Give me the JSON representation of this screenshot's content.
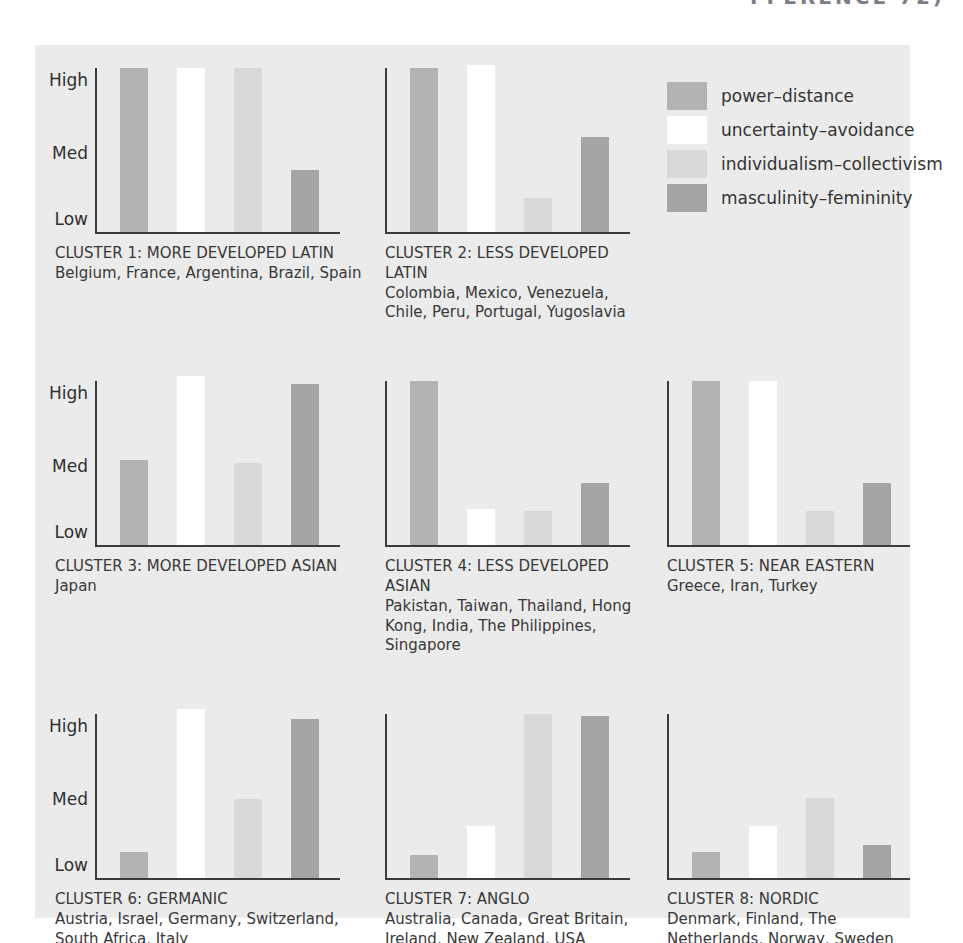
{
  "page": {
    "header_fragment": "FFERENCE 72)"
  },
  "colors": {
    "panel_bg": "#ebebeb",
    "axis": "#3b3b3b",
    "power_distance": "#b3b3b3",
    "uncertainty_avoidance": "#ffffff",
    "individualism_collectivism": "#d9d9d9",
    "masculinity_femininity": "#a5a5a5"
  },
  "axis_labels": [
    "High",
    "Med",
    "Low"
  ],
  "legend": {
    "items": [
      {
        "label": "power–distance",
        "color_key": "power_distance"
      },
      {
        "label": "uncertainty–avoidance",
        "color_key": "uncertainty_avoidance"
      },
      {
        "label": "individualism–collectivism",
        "color_key": "individualism_collectivism"
      },
      {
        "label": "masculinity–femininity",
        "color_key": "masculinity_femininity"
      }
    ]
  },
  "chart_data": {
    "type": "bar",
    "note": "Eight small bar charts; y axis is an ordinal High/Med/Low scale. Values are fractions of full axis height (High = 1.0, Med = 0.5, Low = 0.1).",
    "series_labels": [
      "power–distance",
      "uncertainty–avoidance",
      "individualism–collectivism",
      "masculinity–femininity"
    ],
    "series_color_keys": [
      "power_distance",
      "uncertainty_avoidance",
      "individualism_collectivism",
      "masculinity_femininity"
    ],
    "ylim": [
      0,
      1
    ],
    "yticks": [
      "High",
      "Med",
      "Low"
    ],
    "grid": false,
    "legend_position": "top-right",
    "clusters": [
      {
        "title": "CLUSTER 1: MORE DEVELOPED LATIN",
        "countries": "Belgium, France, Argentina, Brazil, Spain",
        "values": [
          1.0,
          1.0,
          1.0,
          0.38
        ],
        "show_axis_labels": true
      },
      {
        "title": "CLUSTER 2: LESS DEVELOPED LATIN",
        "countries": "Colombia, Mexico, Venezuela, Chile, Peru, Portugal, Yugoslavia",
        "values": [
          1.0,
          1.02,
          0.21,
          0.58
        ],
        "show_axis_labels": false
      },
      {
        "title": "CLUSTER 3: MORE DEVELOPED ASIAN",
        "countries": "Japan",
        "values": [
          0.52,
          1.03,
          0.5,
          0.98
        ],
        "show_axis_labels": true
      },
      {
        "title": "CLUSTER 4: LESS DEVELOPED ASIAN",
        "countries": "Pakistan, Taiwan, Thailand, Hong Kong, India, The Philippines, Singapore",
        "values": [
          1.0,
          0.22,
          0.21,
          0.38
        ],
        "show_axis_labels": false
      },
      {
        "title": "CLUSTER 5: NEAR EASTERN",
        "countries": "Greece, Iran, Turkey",
        "values": [
          1.0,
          1.0,
          0.21,
          0.38
        ],
        "show_axis_labels": false
      },
      {
        "title": "CLUSTER 6: GERMANIC",
        "countries": "Austria, Israel, Germany, Switzerland, South Africa, Italy",
        "values": [
          0.16,
          1.03,
          0.48,
          0.97
        ],
        "show_axis_labels": true
      },
      {
        "title": "CLUSTER 7: ANGLO",
        "countries": "Australia, Canada, Great Britain, Ireland, New Zealand, USA",
        "values": [
          0.14,
          0.32,
          1.0,
          0.99
        ],
        "show_axis_labels": false
      },
      {
        "title": "CLUSTER 8: NORDIC",
        "countries": "Denmark, Finland, The Netherlands, Norway, Sweden",
        "values": [
          0.16,
          0.32,
          0.49,
          0.2
        ],
        "show_axis_labels": false
      }
    ]
  }
}
